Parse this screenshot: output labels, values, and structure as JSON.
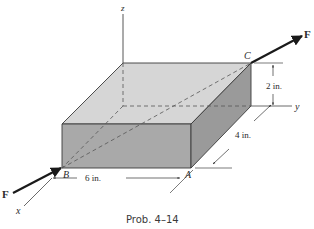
{
  "diagram": {
    "caption": "Prob. 4–14",
    "axes": {
      "x_label": "x",
      "y_label": "y",
      "z_label": "z"
    },
    "points": {
      "A": "A",
      "B": "B",
      "C": "C"
    },
    "force": {
      "label_at_C": "F",
      "label_at_B": "F"
    },
    "dimensions": {
      "length": "6 in.",
      "width": "4 in.",
      "height": "2 in."
    },
    "colors": {
      "top_face": "#d6d6d6",
      "front_face": "#a9a9a9",
      "right_face": "#999999",
      "edge": "#3a3a3a",
      "dashed": "#555555",
      "arrow": "#1a1a1a"
    }
  }
}
